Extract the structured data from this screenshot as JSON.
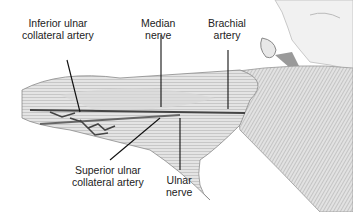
{
  "figure": {
    "labels": [
      {
        "id": "inferior-ulnar-collateral-artery",
        "line1": "Inferior ulnar",
        "line2": "collateral artery"
      },
      {
        "id": "median-nerve",
        "line1": "Median",
        "line2": "nerve"
      },
      {
        "id": "brachial-artery",
        "line1": "Brachial",
        "line2": "artery"
      },
      {
        "id": "superior-ulnar-collateral-artery",
        "line1": "Superior ulnar",
        "line2": "collateral artery"
      },
      {
        "id": "ulnar-nerve",
        "line1": "Ulnar",
        "line2": "nerve"
      }
    ]
  }
}
